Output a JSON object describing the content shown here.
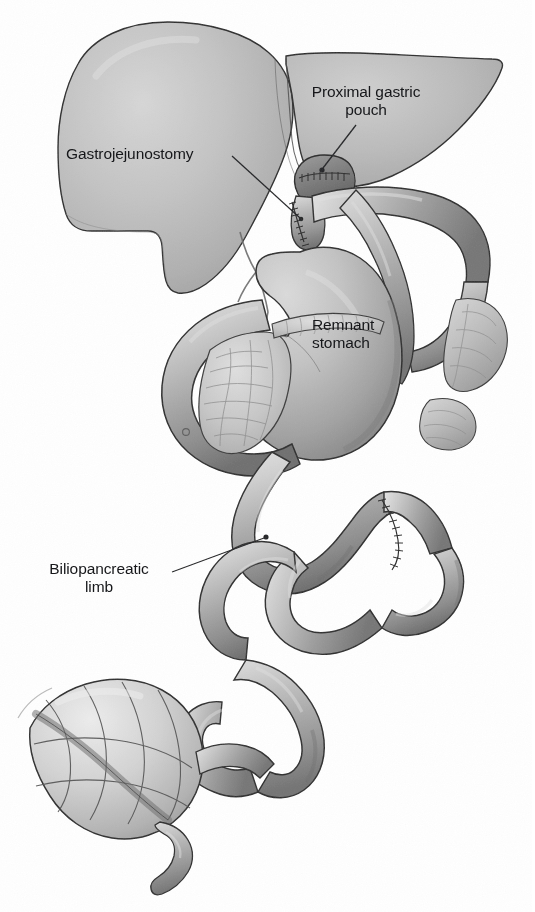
{
  "figure": {
    "width": 535,
    "height": 912,
    "background_color": "#ffffff",
    "style": "grayscale medical line-and-tone illustration"
  },
  "labels": {
    "proximal_gastric_pouch": "Proximal gastric\npouch",
    "gastrojejunostomy": "Gastrojejunostomy",
    "remnant_stomach": "Remnant\nstomach",
    "biliopancreatic_limb": "Biliopancreatic\nlimb"
  },
  "caption": {
    "clipped_text": " "
  },
  "colors": {
    "ink": "#16171a",
    "outline": "#2b2b2b",
    "liver_fill": "#b9b9b9",
    "liver_highlight": "#d2d2d2",
    "liver_shadow": "#9a9a9a",
    "bowel_fill": "#b0b0b0",
    "bowel_highlight": "#dcdcdc",
    "bowel_shadow": "#7b7b7b",
    "stomach_fill": "#b4b4b4",
    "pancreas_fill": "#c3c3c3",
    "colon_fill": "#cbcbcb",
    "pouch_fill": "#8e8e8e",
    "leader_line": "#1d1e21",
    "background": "#ffffff"
  },
  "structures": [
    {
      "name": "liver",
      "label_ref": null,
      "description": "Large retracted liver occupying upper-left; smooth lobar outline with soft tonal shading"
    },
    {
      "name": "proximal-gastric-pouch",
      "label_ref": "proximal_gastric_pouch",
      "description": "Small dark stapled gastric pouch just inferior to the liver edge"
    },
    {
      "name": "gastrojejunostomy",
      "label_ref": "gastrojejunostomy",
      "description": "Sutured anastomosis between gastric pouch and Roux limb"
    },
    {
      "name": "remnant-stomach",
      "label_ref": "remnant_stomach",
      "description": "Excluded distal stomach, large curved body to the right of midline"
    },
    {
      "name": "duodenum",
      "label_ref": null,
      "description": "C-loop of duodenum curving around the pancreatic head"
    },
    {
      "name": "pancreas",
      "label_ref": null,
      "description": "Lobulated pancreas within duodenal C-loop, stippled texture"
    },
    {
      "name": "roux-limb",
      "label_ref": null,
      "description": "Alimentary limb passing from gastrojejunostomy downward and to the right"
    },
    {
      "name": "biliopancreatic-limb",
      "label_ref": "biliopancreatic_limb",
      "description": "Afferent limb carrying bile and pancreatic secretions"
    },
    {
      "name": "jejunojejunostomy",
      "label_ref": null,
      "description": "Stapled/sutured anastomosis joining biliopancreatic limb to common channel"
    },
    {
      "name": "jejunal-loops",
      "label_ref": null,
      "description": "Serpentine small-bowel loops filling mid and lower field"
    },
    {
      "name": "cecum",
      "label_ref": null,
      "description": "Haustrated cecum in lower-left with taenia coli"
    },
    {
      "name": "appendix",
      "label_ref": null,
      "description": "Slender vermiform appendix projecting inferiorly from the cecum"
    },
    {
      "name": "omentum",
      "label_ref": null,
      "description": "Fatty omental fold at right margin behind the bowel loops"
    }
  ],
  "leader_lines": [
    {
      "name": "leader-proximal-gastric-pouch",
      "from": [
        356,
        125
      ],
      "to": [
        322,
        170
      ],
      "terminator": "dot"
    },
    {
      "name": "leader-gastrojejunostomy",
      "from": [
        236,
        158
      ],
      "to": [
        300,
        219
      ],
      "terminator": "dot"
    },
    {
      "name": "leader-biliopancreatic-limb",
      "from": [
        172,
        572
      ],
      "to": [
        265,
        537
      ],
      "terminator": "dot"
    }
  ]
}
